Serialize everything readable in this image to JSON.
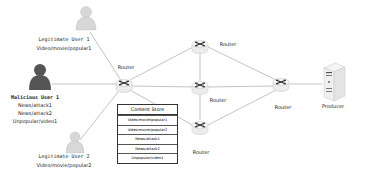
{
  "diagram": {
    "users": [
      {
        "id": "legit1",
        "name": "Legitimate User 1",
        "requests": [
          "Video/movie/popular1"
        ],
        "type": "legitimate"
      },
      {
        "id": "malicious1",
        "name": "Malicious User 1",
        "requests": [
          "News/attack1",
          "News/attack2",
          "Unpopular/video1"
        ],
        "type": "malicious"
      },
      {
        "id": "legit2",
        "name": "Legitimate User 2",
        "requests": [
          "Video/movie/popular2"
        ],
        "type": "legitimate"
      }
    ],
    "routers": {
      "edge": "Router",
      "top": "Router",
      "middle": "Router",
      "bottom": "Router",
      "right": "Router"
    },
    "producer": "Producer",
    "content_store": {
      "title": "Content Store",
      "entries": [
        "Video/movie/popular1",
        "Video/movie/popular2",
        "News/attack1",
        "News/attack2",
        "Unpopular/video1"
      ]
    },
    "colors": {
      "legitimate_user": "#d0d0d0",
      "malicious_user": "#555555",
      "link": "#9a9a9a",
      "router_body": "#f2f2f2",
      "router_arrows": "#333333"
    }
  }
}
